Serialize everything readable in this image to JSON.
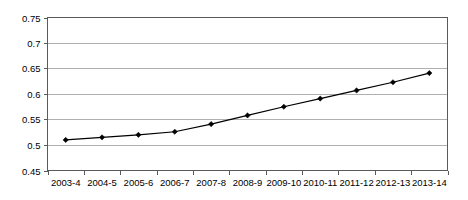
{
  "chart_data": {
    "type": "line",
    "title": "",
    "subtitle": "",
    "xlabel": "",
    "ylabel": "",
    "categories": [
      "2003-4",
      "2004-5",
      "2005-6",
      "2006-7",
      "2007-8",
      "2008-9",
      "2009-10",
      "2010-11",
      "2011-12",
      "2012-13",
      "2013-14"
    ],
    "values": [
      0.51,
      0.515,
      0.52,
      0.526,
      0.541,
      0.558,
      0.575,
      0.591,
      0.607,
      0.623,
      0.641
    ],
    "series": [
      {
        "name": "",
        "values": [
          0.51,
          0.515,
          0.52,
          0.526,
          0.541,
          0.558,
          0.575,
          0.591,
          0.607,
          0.623,
          0.641
        ]
      }
    ],
    "ylim": [
      0.45,
      0.75
    ],
    "yticks": [
      0.75,
      0.7,
      0.65,
      0.6,
      0.55,
      0.5,
      0.45
    ],
    "ytick_labels": [
      "0.75",
      "0.7",
      "0.65",
      "0.6",
      "0.55",
      "0.5",
      "0.45"
    ],
    "grid": true,
    "grid_axis": "y",
    "legend": false,
    "legend_position": "none",
    "marker": "diamond",
    "line_color": "#000000",
    "marker_color": "#000000",
    "grid_color": "#b0b0b0",
    "axis_color": "#5a5a5a",
    "background_color": "#ffffff"
  },
  "axes": {
    "y_tick_labels": [
      "0.75",
      "0.7",
      "0.65",
      "0.6",
      "0.55",
      "0.5",
      "0.45"
    ],
    "x_tick_labels": [
      "2003-4",
      "2004-5",
      "2005-6",
      "2006-7",
      "2007-8",
      "2008-9",
      "2009-10",
      "2010-11",
      "2011-12",
      "2012-13",
      "2013-14"
    ]
  }
}
